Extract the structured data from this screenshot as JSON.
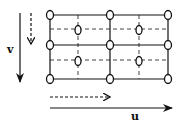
{
  "diagram": {
    "labels": {
      "v": "v",
      "u": "u"
    },
    "colors": {
      "stroke": "#111111",
      "background": "#ffffff"
    },
    "grid": {
      "solid_columns_x": [
        50,
        110,
        168
      ],
      "solid_rows_y": [
        15,
        45,
        79
      ],
      "dashed_columns_x": [
        78,
        139
      ],
      "dashed_rows_y": [
        29,
        60
      ],
      "outer_nodes": [
        [
          50,
          15
        ],
        [
          110,
          15
        ],
        [
          168,
          15
        ],
        [
          50,
          45
        ],
        [
          110,
          45
        ],
        [
          168,
          45
        ],
        [
          50,
          79
        ],
        [
          110,
          79
        ],
        [
          168,
          79
        ]
      ],
      "inner_nodes": [
        [
          78,
          30
        ],
        [
          139,
          30
        ],
        [
          78,
          61
        ],
        [
          139,
          61
        ]
      ]
    },
    "arrows": [
      {
        "name": "v-solid",
        "style": "solid",
        "from": [
          20,
          13
        ],
        "to": [
          20,
          82
        ]
      },
      {
        "name": "v-dashed",
        "style": "dashed",
        "from": [
          31,
          13
        ],
        "to": [
          31,
          45
        ]
      },
      {
        "name": "u-dashed",
        "style": "dashed",
        "from": [
          50,
          97
        ],
        "to": [
          110,
          97
        ]
      },
      {
        "name": "u-solid",
        "style": "solid",
        "from": [
          50,
          108
        ],
        "to": [
          172,
          108
        ]
      }
    ]
  }
}
